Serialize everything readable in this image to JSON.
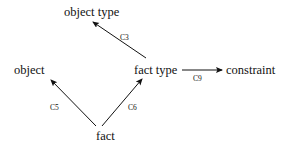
{
  "diagram": {
    "type": "directed-graph",
    "background_color": "#ffffff",
    "stroke_color": "#111111",
    "width": 294,
    "height": 149,
    "nodes": [
      {
        "id": "object_type",
        "label": "object type"
      },
      {
        "id": "object",
        "label": "object"
      },
      {
        "id": "fact_type",
        "label": "fact type"
      },
      {
        "id": "constraint",
        "label": "constraint"
      },
      {
        "id": "fact",
        "label": "fact"
      }
    ],
    "edges": [
      {
        "id": "c3",
        "label": "C3",
        "from": "fact_type",
        "to": "object_type",
        "direction": "up-left"
      },
      {
        "id": "c5",
        "label": "C5",
        "from": "fact",
        "to": "object",
        "direction": "up-left"
      },
      {
        "id": "c6",
        "label": "C6",
        "from": "fact",
        "to": "fact_type",
        "direction": "up-right"
      },
      {
        "id": "c9",
        "label": "C9",
        "from": "fact_type",
        "to": "constraint",
        "direction": "right"
      }
    ]
  }
}
